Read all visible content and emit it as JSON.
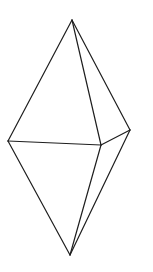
{
  "figure": {
    "background_color": "#ffffff",
    "stroke_color": "#1e1e1e",
    "stroke_width": 1.2,
    "vertices": {
      "top_apex": [
        72,
        20
      ],
      "left": [
        8,
        141
      ],
      "front": [
        101,
        145
      ],
      "right": [
        130,
        130
      ],
      "bottom_apex": [
        70,
        255
      ]
    },
    "edges": [
      [
        "top_apex",
        "left"
      ],
      [
        "top_apex",
        "front"
      ],
      [
        "top_apex",
        "right"
      ],
      [
        "left",
        "front"
      ],
      [
        "front",
        "right"
      ],
      [
        "left",
        "bottom_apex"
      ],
      [
        "front",
        "bottom_apex"
      ],
      [
        "right",
        "bottom_apex"
      ]
    ]
  }
}
